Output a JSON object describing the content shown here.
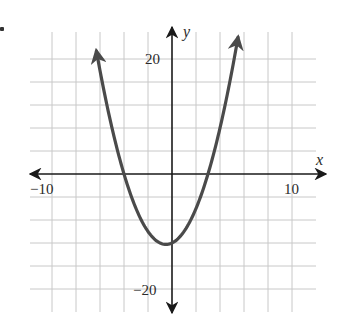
{
  "chart_data": {
    "type": "line",
    "title": "",
    "function": "y = x^2 + x - 12",
    "series": [
      {
        "name": "parabola",
        "x": [
          -6.3,
          -6,
          -5,
          -4,
          -3,
          -2,
          -1,
          -0.5,
          0,
          1,
          2,
          3,
          4,
          5,
          5.5
        ],
        "y": [
          21.39,
          18,
          8,
          0,
          -6,
          -10,
          -12,
          -12.25,
          -12,
          -10,
          -6,
          0,
          8,
          18,
          23.75
        ]
      }
    ],
    "vertex": [
      -0.5,
      -12.25
    ],
    "x_intercepts": [
      -4,
      3
    ],
    "y_intercept": -12,
    "xlabel": "x",
    "ylabel": "y",
    "xlim": [
      -10,
      10
    ],
    "ylim": [
      -24,
      24
    ],
    "x_grid_step": 2,
    "y_grid_step": 4,
    "x_tick_labels": [
      {
        "value": -10,
        "label": "−10"
      },
      {
        "value": 10,
        "label": "10"
      }
    ],
    "y_tick_labels": [
      {
        "value": 20,
        "label": "20"
      },
      {
        "value": -20,
        "label": "−20"
      }
    ],
    "grid": true,
    "legend": "none",
    "colors": {
      "curve": "#4a4a4a",
      "axis": "#1a1a1a",
      "grid": "#c8c8c8"
    }
  },
  "labels": {
    "x_axis_name": "x",
    "y_axis_name": "y",
    "x_neg10": "−10",
    "x_pos10": "10",
    "y_pos20": "20",
    "y_neg20": "−20"
  }
}
